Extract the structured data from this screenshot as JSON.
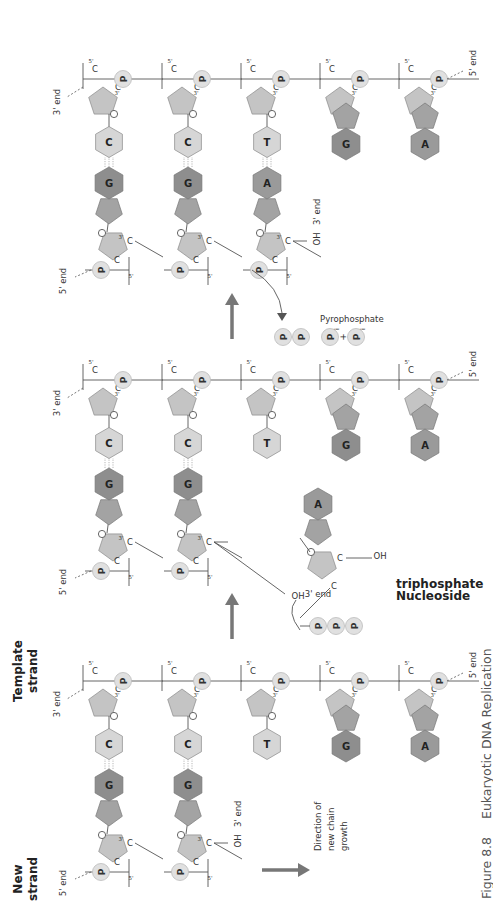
{
  "figure": {
    "number": "Figure 8.8",
    "title": "Eukaryotic DNA Replication"
  },
  "labels": {
    "new_strand_1": "New",
    "new_strand_2": "strand",
    "template_strand_1": "Template",
    "template_strand_2": "strand",
    "five_end": "5' end",
    "three_end": "3' end",
    "oh": "OH",
    "phosphate": "P",
    "pi": "P",
    "pi_sub": "i",
    "plus": "+",
    "pyrophosphate": "Pyrophosphate",
    "nucleoside_1": "Nucleoside",
    "nucleoside_2": "triphosphate",
    "direction_1": "Direction of",
    "direction_2": "new chain",
    "direction_3": "growth",
    "c": "C",
    "three_prime": "3'",
    "five_prime": "5'",
    "o": "O"
  },
  "panels": [
    {
      "name": "initial",
      "template_bases": [
        "C",
        "C",
        "T",
        "G",
        "A"
      ],
      "new_bases": [
        "G",
        "G",
        null,
        null,
        null
      ],
      "new_strand_length": 2
    },
    {
      "name": "incoming-nucleotide",
      "template_bases": [
        "C",
        "C",
        "T",
        "G",
        "A"
      ],
      "new_bases": [
        "G",
        "G",
        null,
        null,
        null
      ],
      "new_strand_length": 2,
      "incoming_base": "A"
    },
    {
      "name": "after-addition",
      "template_bases": [
        "C",
        "C",
        "T",
        "G",
        "A"
      ],
      "new_bases": [
        "G",
        "G",
        "A",
        null,
        null
      ],
      "new_strand_length": 3
    }
  ],
  "colors": {
    "sugar": "#c4c4c4",
    "purine_hex_dark": "#8e8e8e",
    "purine_pent": "#a3a3a3",
    "pyrimidine": "#d6d6d6",
    "phosphate": "#e0e0e0",
    "arrow": "#777777",
    "line": "#555555"
  }
}
